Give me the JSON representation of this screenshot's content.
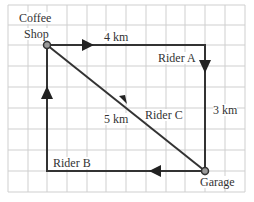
{
  "diagram": {
    "locations": {
      "coffee_shop": {
        "line1": "Coffee",
        "line2": "Shop"
      },
      "garage": "Garage"
    },
    "riders": [
      {
        "name": "Rider A",
        "route": "Coffee Shop → east → south → Garage"
      },
      {
        "name": "Rider B",
        "route": "Garage → west → north → Coffee Shop"
      },
      {
        "name": "Rider C",
        "route": "Coffee Shop → diagonal → Garage"
      }
    ],
    "distances": {
      "top": "4 km",
      "right": "3 km",
      "diagonal": "5 km"
    },
    "labels": {
      "rider_a": "Rider A",
      "rider_b": "Rider B",
      "rider_c": "Rider C"
    },
    "colors": {
      "grid": "#c8c8c8",
      "path": "#333333",
      "point": "#9a9a9a"
    }
  }
}
